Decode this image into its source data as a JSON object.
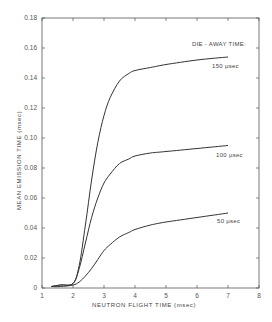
{
  "chart_data": {
    "type": "line",
    "title": "",
    "xlabel": "NEUTRON FLIGHT TIME  (msec)",
    "ylabel": "MEAN EMISSION TIME  (msec)",
    "xlim": [
      1,
      8
    ],
    "ylim": [
      0,
      0.18
    ],
    "xticks": [
      1,
      2,
      3,
      4,
      5,
      6,
      7,
      8
    ],
    "yticks": [
      0,
      0.02,
      0.04,
      0.06,
      0.08,
      0.1,
      0.12,
      0.14,
      0.16,
      0.18
    ],
    "xtick_labels": [
      "1",
      "2",
      "3",
      "4",
      "5",
      "6",
      "7",
      "8"
    ],
    "ytick_labels": [
      "0",
      "0.02",
      "0.04",
      "0.06",
      "0.08",
      "0.10",
      "0.12",
      "0.14",
      "0.16",
      "0.18"
    ],
    "grid": false,
    "legend_title": "DIE - AWAY TIME:",
    "legend_position": "upper right",
    "series": [
      {
        "name": "150 µsec",
        "x": [
          1.3,
          1.6,
          2.0,
          2.2,
          2.4,
          2.6,
          2.8,
          3.0,
          3.2,
          3.5,
          3.8,
          4.0,
          4.5,
          5.0,
          6.0,
          7.0
        ],
        "y": [
          0.001,
          0.002,
          0.003,
          0.015,
          0.042,
          0.072,
          0.097,
          0.115,
          0.127,
          0.138,
          0.143,
          0.145,
          0.147,
          0.149,
          0.152,
          0.154
        ]
      },
      {
        "name": "100 µsec",
        "x": [
          1.3,
          1.6,
          2.0,
          2.2,
          2.4,
          2.6,
          2.8,
          3.0,
          3.2,
          3.5,
          3.8,
          4.0,
          4.5,
          5.0,
          6.0,
          7.0
        ],
        "y": [
          0.001,
          0.002,
          0.003,
          0.013,
          0.03,
          0.047,
          0.06,
          0.07,
          0.076,
          0.083,
          0.086,
          0.088,
          0.09,
          0.091,
          0.093,
          0.095
        ]
      },
      {
        "name": "50 µsec",
        "x": [
          1.3,
          1.6,
          2.0,
          2.2,
          2.4,
          2.6,
          2.8,
          3.0,
          3.2,
          3.5,
          3.8,
          4.0,
          4.5,
          5.0,
          6.0,
          7.0
        ],
        "y": [
          0.001,
          0.001,
          0.002,
          0.004,
          0.008,
          0.013,
          0.019,
          0.025,
          0.029,
          0.034,
          0.037,
          0.039,
          0.042,
          0.044,
          0.047,
          0.05
        ]
      }
    ]
  },
  "labels": {
    "legend_title": "DIE - AWAY TIME:",
    "curve_150": "150 µsec",
    "curve_100": "100 µsec",
    "curve_50": "50 µsec",
    "xlabel": "NEUTRON FLIGHT TIME  (msec)",
    "ylabel": "MEAN EMISSION TIME  (msec)"
  },
  "colors": {
    "line": "#333333",
    "axis": "#555555",
    "background": "#ffffff"
  }
}
